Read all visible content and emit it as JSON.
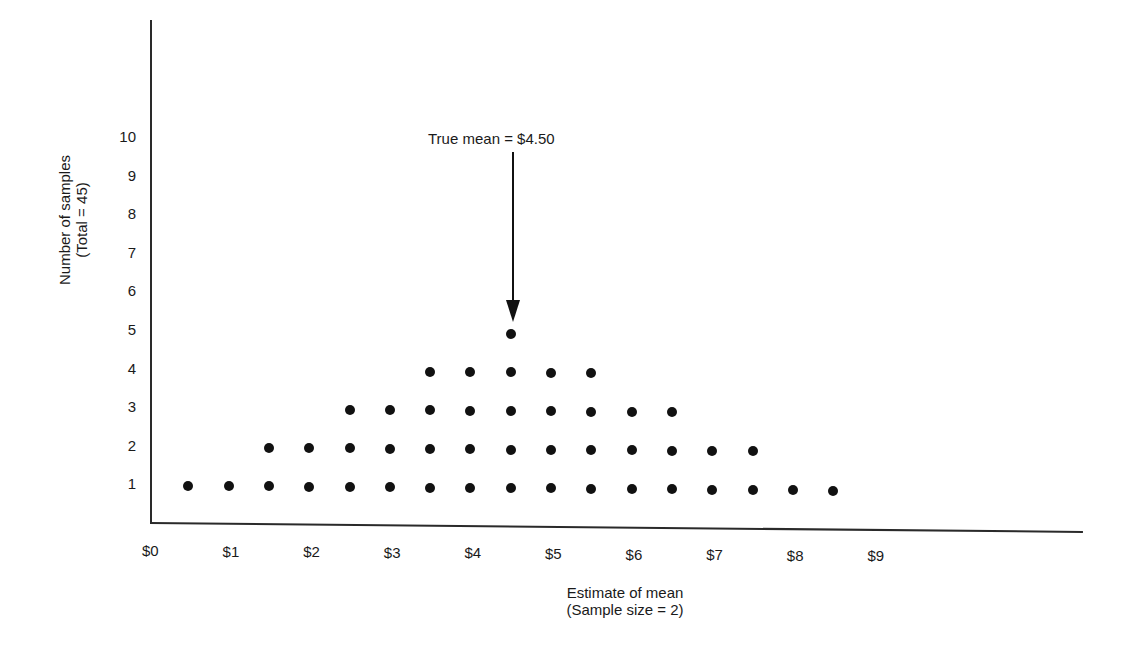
{
  "chart_data": {
    "type": "scatter",
    "subtype": "dot-plot",
    "title": "",
    "xlabel": "Estimate of mean",
    "xlabel_sub": "(Sample size = 2)",
    "ylabel": "Number of samples",
    "ylabel_sub": "(Total = 45)",
    "x_ticks": [
      "$0",
      "$1",
      "$2",
      "$3",
      "$4",
      "$5",
      "$6",
      "$7",
      "$8",
      "$9"
    ],
    "y_ticks": [
      "1",
      "2",
      "3",
      "4",
      "5",
      "6",
      "7",
      "8",
      "9",
      "10"
    ],
    "xlim": [
      0,
      13
    ],
    "ylim": [
      0,
      11
    ],
    "grid": false,
    "legend": null,
    "annotation": {
      "text": "True mean = $4.50",
      "x": 4.5,
      "arrow_to_y": 5
    },
    "x": [
      0.5,
      1.0,
      1.5,
      2.0,
      2.5,
      3.0,
      3.5,
      4.0,
      4.5,
      5.0,
      5.5,
      6.0,
      6.5,
      7.0,
      7.5,
      8.0,
      8.5
    ],
    "counts": [
      1,
      1,
      2,
      2,
      3,
      3,
      4,
      4,
      5,
      4,
      4,
      3,
      3,
      2,
      2,
      1,
      1
    ],
    "total": 45
  }
}
